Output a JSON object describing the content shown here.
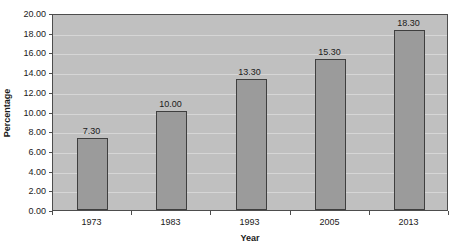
{
  "chart_data": {
    "type": "bar",
    "title": "",
    "categories": [
      "1973",
      "1983",
      "1993",
      "2005",
      "2013"
    ],
    "values": [
      7.3,
      10.0,
      13.3,
      15.3,
      18.3
    ],
    "data_labels": [
      "7.30",
      "10.00",
      "13.30",
      "15.30",
      "18.30"
    ],
    "xlabel": "Year",
    "ylabel": "Percentage",
    "ylim": [
      0,
      20
    ],
    "ytick_step": 2,
    "yticks": [
      "0.00",
      "2.00",
      "4.00",
      "6.00",
      "8.00",
      "10.00",
      "12.00",
      "14.00",
      "16.00",
      "18.00",
      "20.00"
    ],
    "grid": true,
    "legend": false,
    "colors": {
      "page_background": "#ffffff",
      "plot_background": "#c0c0c0",
      "gridline": "#d6d6d6",
      "bar_fill": "#9b9b9b",
      "bar_border": "#3f3f3f",
      "axis_line": "#4d4d4d",
      "text": "#1a1a1a"
    }
  }
}
